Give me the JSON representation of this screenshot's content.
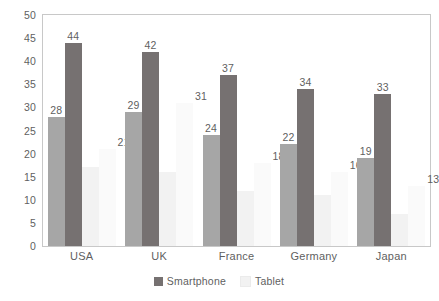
{
  "chart_data": {
    "type": "bar",
    "title": "",
    "subtitle": "",
    "xlabel": "",
    "ylabel": "",
    "categories": [
      "USA",
      "UK",
      "France",
      "Germany",
      "Japan"
    ],
    "series": [
      {
        "name": "Mobile",
        "color": "#a6a6a6",
        "values": [
          28,
          29,
          24,
          22,
          19
        ]
      },
      {
        "name": "Smartphone",
        "color": "#767171",
        "values": [
          44,
          42,
          37,
          34,
          33
        ]
      },
      {
        "name": "Tablet",
        "color": "#f2f2f2",
        "values": [
          17,
          16,
          12,
          11,
          7
        ]
      },
      {
        "name": "Other",
        "color": "#fafafa",
        "values": [
          21,
          31,
          18,
          16,
          13
        ]
      }
    ],
    "ylim": [
      0,
      50
    ],
    "ytick_step": 5,
    "yticks": [
      "0",
      "5",
      "10",
      "15",
      "20",
      "25",
      "30",
      "35",
      "40",
      "45",
      "50"
    ],
    "grid": false,
    "plot_border": true,
    "legend_position": "bottom"
  },
  "legend": {
    "items": [
      {
        "label": "Smartphone",
        "color": "#767171"
      },
      {
        "label": "Tablet",
        "color": "#f2f2f2"
      }
    ]
  }
}
